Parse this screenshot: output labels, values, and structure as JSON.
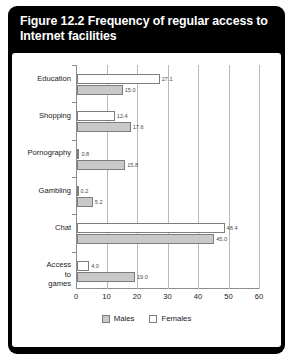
{
  "figure": {
    "title": "Figure 12.2 Frequency of regular access to Internet facilities"
  },
  "legend": {
    "items": [
      {
        "label": "Males",
        "swatch": "males-swatch",
        "color": "#c9c9c9"
      },
      {
        "label": "Females",
        "swatch": "females-swatch",
        "color": "#ffffff"
      }
    ]
  },
  "chart_data": {
    "type": "bar",
    "orientation": "horizontal",
    "title": "Figure 12.2 Frequency of regular access to Internet facilities",
    "xlabel": "",
    "ylabel": "",
    "xlim": [
      0,
      60
    ],
    "xticks": [
      0,
      10,
      20,
      30,
      40,
      50,
      60
    ],
    "xtick_labels": [
      "0",
      "10",
      "20",
      "30",
      "40",
      "50",
      "60"
    ],
    "grid": true,
    "legend_position": "bottom",
    "categories": [
      "Education",
      "Shopping",
      "Pornography",
      "Gambling",
      "Chat",
      "Access to games"
    ],
    "series": [
      {
        "name": "Females",
        "color": "#ffffff",
        "values": [
          27.1,
          12.4,
          0.8,
          0.2,
          48.4,
          4.0
        ],
        "value_labels": [
          "27.1",
          "12.4",
          "0.8",
          "0.2",
          "48.4",
          "4.0"
        ]
      },
      {
        "name": "Males",
        "color": "#c9c9c9",
        "values": [
          15.0,
          17.6,
          15.8,
          5.2,
          45.0,
          19.0
        ],
        "value_labels": [
          "15.0",
          "17.6",
          "15.8",
          "5.2",
          "45.0",
          "19.0"
        ]
      }
    ]
  }
}
